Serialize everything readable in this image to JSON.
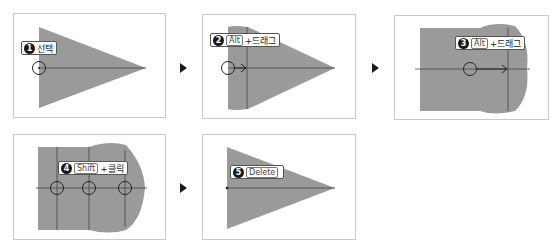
{
  "steps": [
    {
      "number": "1",
      "key": "",
      "text": "선택"
    },
    {
      "number": "2",
      "key": "Alt",
      "text": "+드래그"
    },
    {
      "number": "3",
      "key": "Alt",
      "text": "+드래그"
    },
    {
      "number": "4",
      "key": "Shift",
      "text": "+클릭"
    },
    {
      "number": "5",
      "key": "Delete",
      "text": ""
    }
  ],
  "colors": {
    "shape_fill": "#9a9a9a",
    "guide_line": "#444444",
    "panel_border": "#c9c9c9"
  }
}
